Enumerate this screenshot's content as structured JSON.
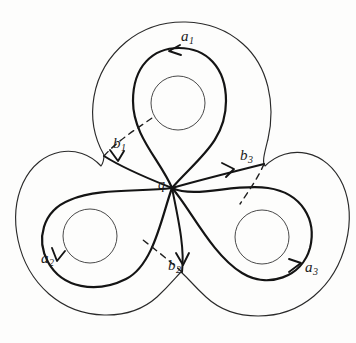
{
  "figure": {
    "type": "topological-diagram",
    "stroke_color": "#1a1a1a",
    "background_color": "#fdfdfc",
    "base_point": {
      "name": "q",
      "label": "q",
      "x": 172,
      "y": 188
    },
    "holes": [
      {
        "name": "hole-top",
        "cx": 178,
        "cy": 103,
        "r": 27
      },
      {
        "name": "hole-left",
        "cx": 90,
        "cy": 236,
        "r": 27
      },
      {
        "name": "hole-right",
        "cx": 262,
        "cy": 237,
        "r": 27
      }
    ],
    "labels": [
      {
        "name": "a1",
        "base": "a",
        "sub": "1",
        "x": 181,
        "y": 36
      },
      {
        "name": "b1",
        "base": "b",
        "sub": "1",
        "x": 113,
        "y": 143
      },
      {
        "name": "b3",
        "base": "b",
        "sub": "3",
        "x": 240,
        "y": 155
      },
      {
        "name": "a2",
        "base": "a",
        "sub": "2",
        "x": 41,
        "y": 258
      },
      {
        "name": "b2",
        "base": "b",
        "sub": "2",
        "x": 168,
        "y": 265
      },
      {
        "name": "a3",
        "base": "a",
        "sub": "3",
        "x": 305,
        "y": 267
      },
      {
        "name": "q",
        "base": "q",
        "sub": "",
        "x": 158,
        "y": 185
      }
    ],
    "curves": [
      {
        "name": "a1-loop",
        "style": "solid",
        "arrow_direction": "left"
      },
      {
        "name": "a2-loop",
        "style": "solid",
        "arrow_direction": "down"
      },
      {
        "name": "a3-loop",
        "style": "solid",
        "arrow_direction": "up-right"
      },
      {
        "name": "b1-loop",
        "style": "mixed-solid-dashed",
        "arrow_direction": "up-left"
      },
      {
        "name": "b2-loop",
        "style": "mixed-solid-dashed",
        "arrow_direction": "down"
      },
      {
        "name": "b3-loop",
        "style": "mixed-solid-dashed",
        "arrow_direction": "up-right"
      }
    ]
  }
}
